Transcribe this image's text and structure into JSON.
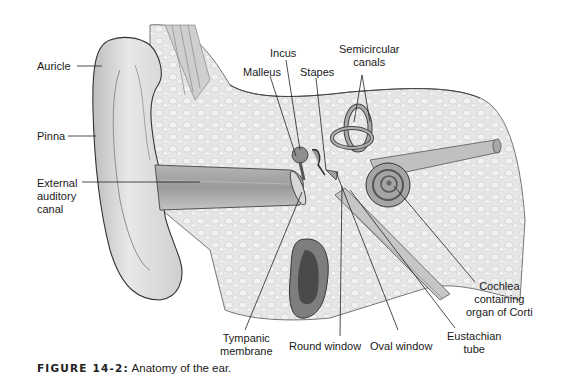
{
  "figure": {
    "caption_number": "FIGURE 14-2:",
    "caption_text": "Anatomy of the ear.",
    "labels": {
      "auricle": "Auricle",
      "pinna": "Pinna",
      "external_auditory_canal": [
        "External",
        "auditory",
        "canal"
      ],
      "incus": "Incus",
      "malleus": "Malleus",
      "stapes": "Stapes",
      "semicircular_canals": [
        "Semicircular",
        "canals"
      ],
      "cochlea": [
        "Cochlea",
        "containing",
        "organ of Corti"
      ],
      "eustachian_tube": [
        "Eustachian",
        "tube"
      ],
      "oval_window": "Oval window",
      "round_window": "Round window",
      "tympanic_membrane": [
        "Tympanic",
        "membrane"
      ]
    }
  }
}
